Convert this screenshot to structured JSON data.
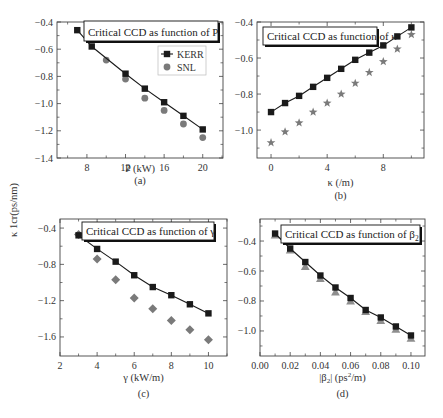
{
  "figure": {
    "ylabel": "κ 1cr(ps/nm)",
    "colors": {
      "kerr": "#1a1a1a",
      "snl": "#7a7a7a",
      "axis": "#444444",
      "line": "#1a1a1a"
    }
  },
  "chart_data": [
    {
      "id": "a",
      "type": "line",
      "panel_label": "(a)",
      "title": "Critical CCD as function of P",
      "xlabel": "P (kW)",
      "ylabel": "κ 1cr(ps/nm)",
      "xlim": [
        4.9,
        22.1
      ],
      "ylim": [
        -1.4,
        -0.4
      ],
      "xticks": [
        8,
        12,
        16,
        20
      ],
      "xtick_labels": [
        "8",
        "12",
        "16",
        "20"
      ],
      "xminor": [
        6,
        10,
        14,
        18,
        22
      ],
      "yticks": [
        -0.4,
        -0.6,
        -0.8,
        -1.0,
        -1.2,
        -1.4
      ],
      "ytick_labels": [
        "-0.4",
        "-0.6",
        "-0.8",
        "-1.0",
        "-1.2",
        "-1.4"
      ],
      "yminor": [
        -0.5,
        -0.7,
        -0.9,
        -1.1,
        -1.3
      ],
      "legend": {
        "show": true,
        "entries": [
          "KERR",
          "SNL"
        ]
      },
      "grid": false,
      "series": [
        {
          "name": "KERR",
          "marker": "square",
          "line": true,
          "x": [
            7,
            8.5,
            12,
            14,
            16,
            18,
            20
          ],
          "y": [
            -0.46,
            -0.58,
            -0.78,
            -0.89,
            -0.99,
            -1.09,
            -1.19
          ]
        },
        {
          "name": "SNL",
          "marker": "circle",
          "line": false,
          "x": [
            10,
            12,
            14,
            16,
            18,
            20
          ],
          "y": [
            -0.68,
            -0.82,
            -0.96,
            -1.05,
            -1.15,
            -1.25
          ]
        }
      ]
    },
    {
      "id": "b",
      "type": "line",
      "panel_label": "(b)",
      "title": "Critical CCD as function of κ",
      "xlabel": "κ (/m)",
      "ylabel": "",
      "xlim": [
        -1,
        10.9
      ],
      "ylim": [
        -1.155,
        -0.4
      ],
      "xticks": [
        0,
        4,
        8
      ],
      "xtick_labels": [
        "0",
        "4",
        "8"
      ],
      "xminor": [
        2,
        6,
        10
      ],
      "yticks": [
        -0.4,
        -0.6,
        -0.8,
        -1.0
      ],
      "ytick_labels": [
        "-0.4",
        "-0.6",
        "-0.8",
        "-1.0"
      ],
      "yminor": [
        -0.5,
        -0.7,
        -0.9,
        -1.1
      ],
      "legend": {
        "show": false,
        "entries": []
      },
      "grid": false,
      "series": [
        {
          "name": "KERR",
          "marker": "square",
          "line": true,
          "x": [
            0,
            1,
            2,
            3,
            4,
            5,
            6,
            7,
            8,
            9,
            10
          ],
          "y": [
            -0.9,
            -0.85,
            -0.81,
            -0.76,
            -0.71,
            -0.66,
            -0.61,
            -0.57,
            -0.53,
            -0.48,
            -0.43
          ]
        },
        {
          "name": "SNL",
          "marker": "star",
          "line": false,
          "x": [
            0,
            1,
            2,
            3,
            4,
            5,
            6,
            7,
            8,
            9,
            10
          ],
          "y": [
            -1.07,
            -1.01,
            -0.96,
            -0.9,
            -0.85,
            -0.8,
            -0.74,
            -0.68,
            -0.62,
            -0.55,
            -0.47
          ]
        }
      ]
    },
    {
      "id": "c",
      "type": "line",
      "panel_label": "(c)",
      "title": "Critical CCD as function of γ",
      "xlabel": "γ (kW/m)",
      "ylabel": "",
      "xlim": [
        2,
        11
      ],
      "ylim": [
        -1.81,
        -0.3
      ],
      "xticks": [
        2,
        4,
        6,
        8,
        10
      ],
      "xtick_labels": [
        "2",
        "4",
        "6",
        "8",
        "10"
      ],
      "xminor": [
        3,
        5,
        7,
        9,
        11
      ],
      "yticks": [
        -0.4,
        -0.8,
        -1.2,
        -1.6
      ],
      "ytick_labels": [
        "-0.4",
        "-0.8",
        "-1.2",
        "-1.6"
      ],
      "yminor": [
        -0.6,
        -1.0,
        -1.4
      ],
      "legend": {
        "show": false,
        "entries": []
      },
      "grid": false,
      "series": [
        {
          "name": "KERR",
          "marker": "square",
          "line": true,
          "x": [
            3,
            4,
            5,
            6,
            7,
            8,
            9,
            10
          ],
          "y": [
            -0.48,
            -0.63,
            -0.77,
            -0.92,
            -1.05,
            -1.14,
            -1.24,
            -1.34
          ]
        },
        {
          "name": "SNL",
          "marker": "diamond",
          "line": false,
          "x": [
            3,
            4,
            5,
            6,
            7,
            8,
            9,
            10
          ],
          "y": [
            -0.47,
            -0.74,
            -0.97,
            -1.17,
            -1.29,
            -1.42,
            -1.52,
            -1.63
          ]
        }
      ]
    },
    {
      "id": "d",
      "type": "line",
      "panel_label": "(d)",
      "title": "Critical CCD as function of β",
      "title_sub": "2",
      "xlabel": "|β",
      "xlabel_sub": "2",
      "xlabel_rest": "| (ps",
      "xlabel_sup": "2",
      "xlabel_end": "/m)",
      "ylabel": "",
      "xlim": [
        0.0,
        0.1093
      ],
      "ylim": [
        -1.167,
        -0.253
      ],
      "xticks": [
        0.0,
        0.02,
        0.04,
        0.06,
        0.08,
        0.1
      ],
      "xtick_labels": [
        "0.00",
        "0.02",
        "0.04",
        "0.06",
        "0.08",
        "0.10"
      ],
      "xminor": [
        0.01,
        0.03,
        0.05,
        0.07,
        0.09
      ],
      "yticks": [
        -0.4,
        -0.6,
        -0.8,
        -1.0
      ],
      "ytick_labels": [
        "-0.4",
        "-0.6",
        "-0.8",
        "-1.0"
      ],
      "yminor": [
        -0.3,
        -0.5,
        -0.7,
        -0.9,
        -1.1
      ],
      "legend": {
        "show": false,
        "entries": []
      },
      "grid": false,
      "series": [
        {
          "name": "KERR",
          "marker": "square",
          "line": true,
          "x": [
            0.01,
            0.02,
            0.03,
            0.04,
            0.05,
            0.06,
            0.07,
            0.08,
            0.09,
            0.1
          ],
          "y": [
            -0.35,
            -0.45,
            -0.54,
            -0.63,
            -0.71,
            -0.78,
            -0.86,
            -0.91,
            -0.97,
            -1.03
          ]
        },
        {
          "name": "SNL",
          "marker": "triangle",
          "line": false,
          "x": [
            0.01,
            0.02,
            0.03,
            0.04,
            0.05,
            0.06,
            0.07,
            0.08,
            0.09,
            0.1
          ],
          "y": [
            -0.36,
            -0.46,
            -0.57,
            -0.65,
            -0.74,
            -0.8,
            -0.87,
            -0.93,
            -0.99,
            -1.05
          ]
        }
      ]
    }
  ]
}
